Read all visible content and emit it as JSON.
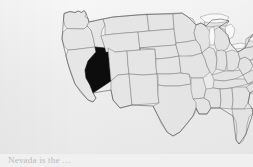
{
  "figure": {
    "kind": "choropleth-map",
    "region": "United States",
    "title": "",
    "background_color": "#efefef"
  },
  "map": {
    "name": "united-states-map",
    "projection_note": "contiguous 48 states",
    "state_fill_color": "#e6e6e6",
    "state_border_color": "#6e6e6e",
    "highlight_fill_color": "#0d0d0d",
    "lake_fill_color": "#fbfbfb",
    "highlighted_states": [
      "Nevada"
    ],
    "highlight_label": "Nevada",
    "states": [
      "Washington",
      "Oregon",
      "California",
      "Nevada",
      "Idaho",
      "Montana",
      "Wyoming",
      "Utah",
      "Arizona",
      "Colorado",
      "New Mexico",
      "North Dakota",
      "South Dakota",
      "Nebraska",
      "Kansas",
      "Oklahoma",
      "Texas",
      "Minnesota",
      "Iowa",
      "Missouri",
      "Arkansas",
      "Louisiana",
      "Wisconsin",
      "Illinois",
      "Michigan",
      "Indiana",
      "Ohio",
      "Kentucky",
      "Tennessee",
      "Mississippi",
      "Alabama",
      "Georgia",
      "Florida",
      "South Carolina",
      "North Carolina",
      "Virginia",
      "West Virginia",
      "Maryland",
      "Delaware",
      "Pennsylvania",
      "New Jersey",
      "New York",
      "Connecticut",
      "Rhode Island",
      "Massachusetts",
      "Vermont",
      "New Hampshire",
      "Maine"
    ]
  },
  "caption": {
    "text": "Nevada is the …",
    "visible": "clipped"
  }
}
